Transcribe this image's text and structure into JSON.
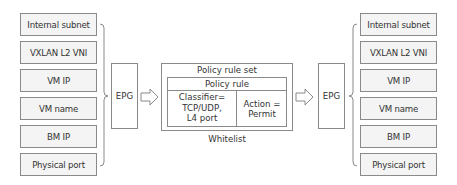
{
  "left_group": {
    "items": [
      "Internal subnet",
      "VXLAN L2 VNI",
      "VM IP",
      "VM name",
      "BM IP",
      "Physical port"
    ],
    "epg_label": "EPG"
  },
  "policy": {
    "set_title": "Policy rule set",
    "rule_title": "Policy rule",
    "classifier_lines": [
      "Classifier=",
      "TCP/UDP,",
      "L4 port"
    ],
    "action_lines": [
      "Action =",
      "Permit"
    ],
    "caption": "Whitelist"
  },
  "right_group": {
    "epg_label": "EPG",
    "items": [
      "Internal subnet",
      "VXLAN L2 VNI",
      "VM IP",
      "VM name",
      "BM IP",
      "Physical port"
    ]
  },
  "colors": {
    "border": "#8a8a8a",
    "box_fill": "#f4f4f4",
    "text": "#333333"
  }
}
